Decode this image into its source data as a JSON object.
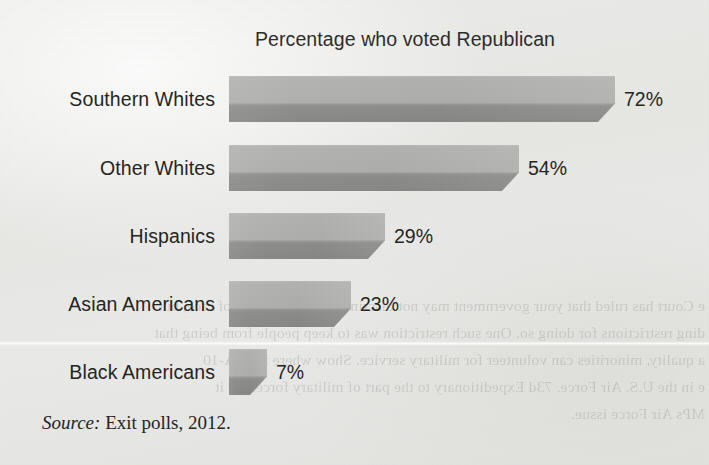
{
  "figure": {
    "title": "Percentage who voted Republican",
    "source_label": "Source:",
    "source_text": "Exit polls, 2012.",
    "bleed_through_lines": [
      "e Court has ruled that your government may not discriminate on the basis of race, but",
      "ding restrictions for doing so. One such restriction was to keep people from being that",
      "a quality, minorities can volunteer for military service. Show where is an A-10",
      "e in the U.S. Air Force. 73d Expeditionary to the part of military forces, or it",
      "MPs Air Force issue."
    ]
  },
  "chart_data": {
    "type": "bar",
    "orientation": "horizontal",
    "title": "Percentage who voted Republican",
    "xlabel": "",
    "ylabel": "",
    "xlim": [
      0,
      100
    ],
    "grid": false,
    "legend": false,
    "units": "%",
    "categories": [
      "Southern Whites",
      "Other Whites",
      "Hispanics",
      "Asian Americans",
      "Black Americans"
    ],
    "values": [
      72,
      54,
      29,
      23,
      7
    ],
    "value_labels": [
      "72%",
      "54%",
      "29%",
      "23%",
      "7%"
    ],
    "colors": {
      "bar_light_face": "#b4b4b2",
      "bar_dark_face": "#8e8e8c",
      "background": "#e9e9e7",
      "text": "#242424"
    },
    "bars": [
      {
        "category": "Southern Whites",
        "value": 72,
        "label": "72%",
        "bar_width_px": 386,
        "top_px": 76
      },
      {
        "category": "Other Whites",
        "value": 54,
        "label": "54%",
        "bar_width_px": 290,
        "top_px": 145
      },
      {
        "category": "Hispanics",
        "value": 29,
        "label": "29%",
        "bar_width_px": 156,
        "top_px": 213
      },
      {
        "category": "Asian Americans",
        "value": 23,
        "label": "23%",
        "bar_width_px": 122,
        "top_px": 281
      },
      {
        "category": "Black Americans",
        "value": 7,
        "label": "7%",
        "bar_width_px": 38,
        "top_px": 349
      }
    ]
  }
}
